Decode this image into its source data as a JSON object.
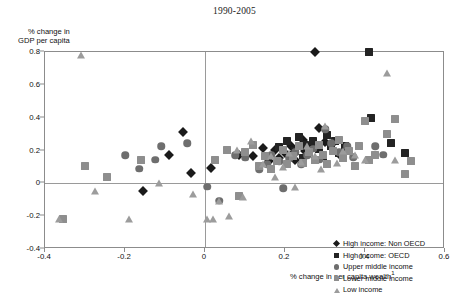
{
  "chart_data": {
    "type": "scatter",
    "title": "1990-2005",
    "xlabel": "% change in per capita wealth",
    "xlabel_footnote": "1",
    "ylabel_line1": "% change in",
    "ylabel_line2": "GDP per capita",
    "xlim": [
      -0.4,
      0.6
    ],
    "ylim": [
      -0.4,
      0.8
    ],
    "xticks": [
      "-0.4",
      "-0.2",
      "0",
      "0.2",
      "0.4",
      "0.6"
    ],
    "xtick_values": [
      -0.4,
      -0.2,
      0,
      0.2,
      0.4,
      0.6
    ],
    "yticks": [
      "0.8",
      "0.6",
      "0.4",
      "0.2",
      "0",
      "-0.2",
      "-0.4"
    ],
    "ytick_values": [
      0.8,
      0.6,
      0.4,
      0.2,
      0,
      -0.2,
      -0.4
    ],
    "grid": false,
    "zero_lines": true,
    "legend_position": "lower-right-inside",
    "series": [
      {
        "name": "High income: Non OECD",
        "marker": "diamond",
        "color": "#1a1a1a",
        "points": [
          [
            -0.155,
            -0.045
          ],
          [
            -0.09,
            0.175
          ],
          [
            -0.055,
            0.315
          ],
          [
            -0.035,
            0.065
          ],
          [
            0.015,
            0.095
          ],
          [
            0.085,
            0.175
          ],
          [
            0.12,
            0.165
          ],
          [
            0.145,
            0.215
          ],
          [
            0.16,
            0.135
          ],
          [
            0.175,
            0.205
          ],
          [
            0.185,
            0.155
          ],
          [
            0.2,
            0.185
          ],
          [
            0.215,
            0.23
          ],
          [
            0.225,
            0.145
          ],
          [
            0.245,
            0.265
          ],
          [
            0.25,
            0.2
          ],
          [
            0.265,
            0.225
          ],
          [
            0.275,
            0.8
          ],
          [
            0.285,
            0.335
          ],
          [
            0.3,
            0.25
          ],
          [
            0.315,
            0.235
          ],
          [
            0.335,
            0.18
          ],
          [
            0.345,
            0.19
          ]
        ]
      },
      {
        "name": "High income: OECD",
        "marker": "square",
        "color": "#232323",
        "points": [
          [
            0.185,
            0.22
          ],
          [
            0.205,
            0.255
          ],
          [
            0.215,
            0.17
          ],
          [
            0.225,
            0.2
          ],
          [
            0.235,
            0.28
          ],
          [
            0.245,
            0.155
          ],
          [
            0.25,
            0.235
          ],
          [
            0.26,
            0.19
          ],
          [
            0.27,
            0.26
          ],
          [
            0.285,
            0.21
          ],
          [
            0.295,
            0.165
          ],
          [
            0.305,
            0.295
          ],
          [
            0.315,
            0.225
          ],
          [
            0.325,
            0.255
          ],
          [
            0.335,
            0.185
          ],
          [
            0.35,
            0.23
          ],
          [
            0.41,
            0.8
          ],
          [
            0.415,
            0.4
          ],
          [
            0.465,
            0.245
          ],
          [
            0.5,
            0.185
          ]
        ]
      },
      {
        "name": "Upper middle income",
        "marker": "circle",
        "color": "#6e6e6e",
        "points": [
          [
            -0.2,
            0.17
          ],
          [
            -0.165,
            0.09
          ],
          [
            -0.125,
            0.145
          ],
          [
            -0.11,
            0.225
          ],
          [
            -0.045,
            0.245
          ],
          [
            0.005,
            -0.02
          ],
          [
            0.035,
            -0.105
          ],
          [
            0.075,
            0.17
          ],
          [
            0.1,
            0.155
          ],
          [
            0.135,
            0.085
          ],
          [
            0.155,
            0.115
          ],
          [
            0.165,
            0.175
          ],
          [
            0.185,
            0.135
          ],
          [
            0.195,
            -0.03
          ],
          [
            0.21,
            0.15
          ],
          [
            0.225,
            0.19
          ],
          [
            0.24,
            0.115
          ],
          [
            0.255,
            0.17
          ],
          [
            0.27,
            0.21
          ],
          [
            0.285,
            0.145
          ],
          [
            0.3,
            0.33
          ],
          [
            0.315,
            0.245
          ],
          [
            0.335,
            0.19
          ],
          [
            0.355,
            0.225
          ],
          [
            0.37,
            0.16
          ],
          [
            0.425,
            0.225
          ],
          [
            0.445,
            0.175
          ]
        ]
      },
      {
        "name": "Lower middle income",
        "marker": "square",
        "color": "#8e8e8e",
        "points": [
          [
            -0.355,
            -0.215
          ],
          [
            -0.3,
            0.105
          ],
          [
            -0.245,
            0.04
          ],
          [
            -0.16,
            0.145
          ],
          [
            0.025,
            0.145
          ],
          [
            0.055,
            0.205
          ],
          [
            0.085,
            -0.075
          ],
          [
            0.1,
            0.19
          ],
          [
            0.12,
            0.235
          ],
          [
            0.135,
            0.105
          ],
          [
            0.15,
            0.165
          ],
          [
            0.165,
            0.09
          ],
          [
            0.18,
            0.135
          ],
          [
            0.195,
            0.205
          ],
          [
            0.205,
            0.115
          ],
          [
            0.22,
            0.165
          ],
          [
            0.235,
            0.225
          ],
          [
            0.245,
            0.125
          ],
          [
            0.26,
            0.19
          ],
          [
            0.275,
            0.145
          ],
          [
            0.285,
            0.235
          ],
          [
            0.295,
            0.175
          ],
          [
            0.305,
            0.115
          ],
          [
            0.32,
            0.2
          ],
          [
            0.335,
            0.265
          ],
          [
            0.345,
            0.155
          ],
          [
            0.36,
            0.195
          ],
          [
            0.375,
            0.105
          ],
          [
            0.385,
            0.225
          ],
          [
            0.4,
            0.38
          ],
          [
            0.41,
            0.145
          ],
          [
            0.425,
            0.175
          ],
          [
            0.455,
            0.3
          ],
          [
            0.475,
            0.39
          ],
          [
            0.5,
            0.055
          ],
          [
            0.515,
            0.135
          ]
        ]
      },
      {
        "name": "Low income",
        "marker": "triangle",
        "color": "#9c9c9c",
        "points": [
          [
            -0.365,
            -0.22
          ],
          [
            -0.31,
            0.78
          ],
          [
            -0.275,
            -0.045
          ],
          [
            -0.19,
            -0.215
          ],
          [
            -0.115,
            0.005
          ],
          [
            -0.03,
            -0.065
          ],
          [
            0.005,
            -0.215
          ],
          [
            0.02,
            -0.215
          ],
          [
            0.035,
            -0.105
          ],
          [
            0.06,
            -0.2
          ],
          [
            0.08,
            0.205
          ],
          [
            0.095,
            -0.085
          ],
          [
            0.115,
            0.255
          ],
          [
            0.145,
            0.115
          ],
          [
            0.165,
            0.165
          ],
          [
            0.175,
            0.04
          ],
          [
            0.195,
            0.1
          ],
          [
            0.21,
            0.185
          ],
          [
            0.225,
            -0.025
          ],
          [
            0.24,
            0.13
          ],
          [
            0.255,
            0.225
          ],
          [
            0.275,
            0.165
          ],
          [
            0.29,
            0.09
          ],
          [
            0.3,
            0.35
          ],
          [
            0.33,
            0.125
          ],
          [
            0.345,
            0.195
          ],
          [
            0.375,
            0.175
          ],
          [
            0.4,
            0.145
          ],
          [
            0.455,
            0.67
          ],
          [
            0.475,
            0.145
          ]
        ]
      }
    ]
  },
  "legend": {
    "items": [
      {
        "label": "High income: Non OECD",
        "marker": "diamond",
        "color": "#1a1a1a"
      },
      {
        "label": "High income: OECD",
        "marker": "square",
        "color": "#232323"
      },
      {
        "label": "Upper middle income",
        "marker": "circle",
        "color": "#6e6e6e"
      },
      {
        "label": "Lower middle income",
        "marker": "square",
        "color": "#8e8e8e"
      },
      {
        "label": "Low income",
        "marker": "triangle",
        "color": "#9c9c9c"
      }
    ]
  }
}
